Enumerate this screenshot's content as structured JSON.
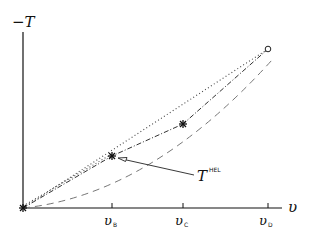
{
  "axes": {
    "y_label": "−T",
    "x_label": "υ",
    "ticks": [
      {
        "main": "υ",
        "sub": "B",
        "x": 112
      },
      {
        "main": "υ",
        "sub": "C",
        "x": 183
      },
      {
        "main": "υ",
        "sub": "D",
        "x": 268
      }
    ]
  },
  "annotation": {
    "main": "T",
    "sup": "HEL"
  },
  "colors": {
    "ink": "#111111",
    "dashed_curve": "#777777",
    "dotted": "#444444"
  },
  "points": {
    "origin": [
      23,
      208
    ],
    "B": [
      112,
      156
    ],
    "C": [
      183,
      124
    ],
    "D": [
      268,
      49
    ]
  }
}
